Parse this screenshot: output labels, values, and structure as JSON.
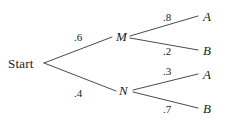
{
  "diagram": {
    "type": "probability-tree",
    "title": "",
    "stroke_color": "#4a4a4a",
    "text_color": "#1a1a1a",
    "background_color": "#ffffff",
    "nodes": {
      "root": {
        "label": "Start",
        "x": 8,
        "y": 57
      },
      "m": {
        "label": "M",
        "x": 116,
        "y": 30
      },
      "n": {
        "label": "N",
        "x": 119,
        "y": 84
      },
      "a_top": {
        "label": "A",
        "x": 203,
        "y": 10
      },
      "b_top": {
        "label": "B",
        "x": 203,
        "y": 44
      },
      "a_bottom": {
        "label": "A",
        "x": 203,
        "y": 68
      },
      "b_bottom": {
        "label": "B",
        "x": 203,
        "y": 102
      }
    },
    "edges": [
      {
        "from": "Start",
        "to": "M",
        "probability": ".6",
        "label_x": 74,
        "label_y": 32
      },
      {
        "from": "Start",
        "to": "N",
        "probability": ".4",
        "label_x": 74,
        "label_y": 88
      },
      {
        "from": "M",
        "to": "A",
        "probability": ".8",
        "label_x": 163,
        "label_y": 12
      },
      {
        "from": "M",
        "to": "B",
        "probability": ".2",
        "label_x": 163,
        "label_y": 46
      },
      {
        "from": "N",
        "to": "A",
        "probability": ".3",
        "label_x": 163,
        "label_y": 66
      },
      {
        "from": "N",
        "to": "B",
        "probability": ".7",
        "label_x": 163,
        "label_y": 104
      }
    ],
    "lines": [
      {
        "name": "edge-start-m",
        "x1": 44,
        "y1": 63,
        "x2": 112,
        "y2": 37
      },
      {
        "name": "edge-start-n",
        "x1": 44,
        "y1": 63,
        "x2": 116,
        "y2": 91
      },
      {
        "name": "edge-m-a",
        "x1": 130,
        "y1": 36,
        "x2": 198,
        "y2": 16
      },
      {
        "name": "edge-m-b",
        "x1": 130,
        "y1": 38,
        "x2": 198,
        "y2": 50
      },
      {
        "name": "edge-n-a",
        "x1": 133,
        "y1": 90,
        "x2": 198,
        "y2": 74
      },
      {
        "name": "edge-n-b",
        "x1": 133,
        "y1": 92,
        "x2": 198,
        "y2": 108
      }
    ]
  },
  "chart_data": {
    "type": "tree",
    "root": "Start",
    "levels": [
      {
        "name": "first-stage",
        "outcomes": [
          "M",
          "N"
        ],
        "probabilities": [
          0.6,
          0.4
        ],
        "probability_labels": [
          ".6",
          ".4"
        ]
      },
      {
        "name": "second-stage",
        "branches": [
          {
            "parent": "M",
            "outcomes": [
              "A",
              "B"
            ],
            "probabilities": [
              0.8,
              0.2
            ],
            "probability_labels": [
              ".8",
              ".2"
            ]
          },
          {
            "parent": "N",
            "outcomes": [
              "A",
              "B"
            ],
            "probabilities": [
              0.3,
              0.7
            ],
            "probability_labels": [
              ".3",
              ".7"
            ]
          }
        ]
      }
    ],
    "paths": [
      {
        "sequence": [
          "Start",
          "M",
          "A"
        ],
        "probability": 0.48
      },
      {
        "sequence": [
          "Start",
          "M",
          "B"
        ],
        "probability": 0.12
      },
      {
        "sequence": [
          "Start",
          "N",
          "A"
        ],
        "probability": 0.12
      },
      {
        "sequence": [
          "Start",
          "N",
          "B"
        ],
        "probability": 0.28
      }
    ]
  }
}
